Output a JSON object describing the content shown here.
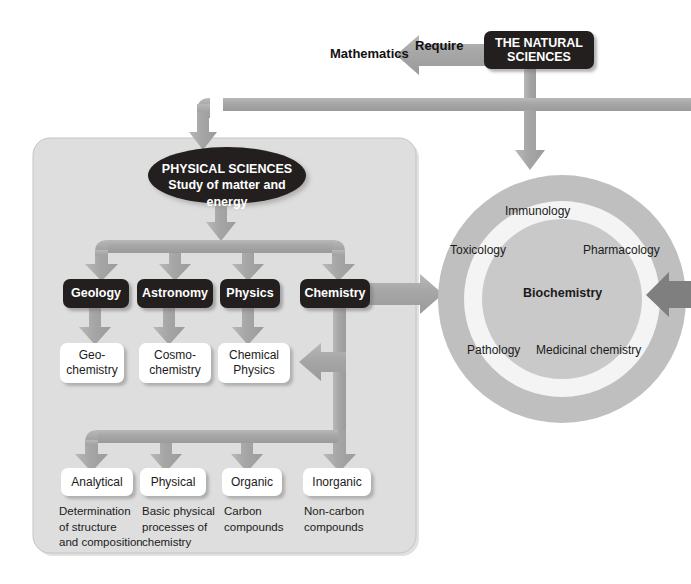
{
  "diagram": {
    "title": "The Natural Sciences",
    "root": {
      "label": "THE NATURAL\nSCIENCES",
      "label_line1": "THE NATURAL",
      "label_line2": "SCIENCES"
    },
    "require_edge": {
      "label": "Require",
      "target": "Mathematics"
    },
    "physical_sciences": {
      "title": "PHYSICAL SCIENCES",
      "subtitle": "Study of matter and energy",
      "branches": [
        {
          "label": "Geology",
          "child": "Geo-\nchemistry",
          "child_line1": "Geo-",
          "child_line2": "chemistry"
        },
        {
          "label": "Astronomy",
          "child": "Cosmo-\nchemistry",
          "child_line1": "Cosmo-",
          "child_line2": "chemistry"
        },
        {
          "label": "Physics",
          "child": "Chemical\nPhysics",
          "child_line1": "Chemical",
          "child_line2": "Physics"
        },
        {
          "label": "Chemistry",
          "child": null,
          "child_line1": "",
          "child_line2": ""
        }
      ],
      "chemistry_subfields": [
        {
          "label": "Analytical",
          "caption": "Determination\nof structure\nand composition",
          "caption_line1": "Determination",
          "caption_line2": "of structure",
          "caption_line3": "and composition"
        },
        {
          "label": "Physical",
          "caption": "Basic physical\nprocesses of\nchemistry",
          "caption_line1": "Basic physical",
          "caption_line2": "processes of",
          "caption_line3": "chemistry"
        },
        {
          "label": "Organic",
          "caption": "Carbon\ncompounds",
          "caption_line1": "Carbon",
          "caption_line2": "compounds",
          "caption_line3": ""
        },
        {
          "label": "Inorganic",
          "caption": "Non-carbon\ncompounds",
          "caption_line1": "Non-carbon",
          "caption_line2": "compounds",
          "caption_line3": ""
        }
      ]
    },
    "biochemistry_wheel": {
      "center": "Biochemistry",
      "ring_labels": [
        "Immunology",
        "Toxicology",
        "Pharmacology",
        "Pathology",
        "Medicinal chemistry"
      ]
    },
    "colors": {
      "node_dark": "#231f1f",
      "node_white": "#ffffff",
      "arrow_gray": "#a9a9a9",
      "arrow_dark_gray": "#7d7d7d",
      "panel_gray": "#dcdcdc",
      "ring_outer": "#bdbdbd",
      "ring_light": "#f2f2f2",
      "ring_inner": "#c9c9c9",
      "text_dark": "#1b1b1b",
      "background": "#ffffff"
    }
  }
}
